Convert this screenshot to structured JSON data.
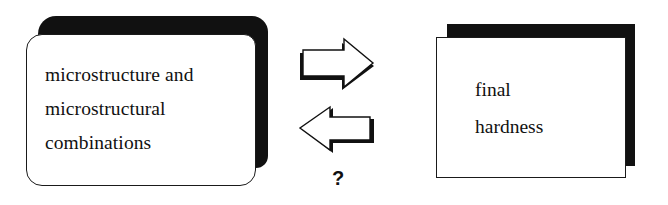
{
  "diagram": {
    "left_box": {
      "lines": [
        "microstructure and",
        "microstructural",
        "combinations"
      ]
    },
    "right_box": {
      "lines": [
        "final",
        "hardness"
      ]
    },
    "arrows": [
      {
        "direction": "right",
        "from": "left_box",
        "to": "right_box"
      },
      {
        "direction": "left",
        "from": "right_box",
        "to": "left_box",
        "label": "?"
      }
    ],
    "question_label": "?",
    "colors": {
      "ink": "#111111",
      "background": "#ffffff"
    }
  }
}
